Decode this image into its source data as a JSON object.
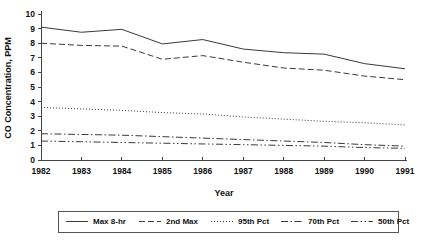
{
  "chart_data": {
    "type": "line",
    "title": "",
    "xlabel": "Year",
    "ylabel": "CO Concentration, PPM",
    "x": [
      1982,
      1983,
      1984,
      1985,
      1986,
      1987,
      1988,
      1989,
      1990,
      1991
    ],
    "categories": [
      "1982",
      "1983",
      "1984",
      "1985",
      "1986",
      "1987",
      "1988",
      "1989",
      "1990",
      "1991"
    ],
    "xlim": [
      1982,
      1991
    ],
    "ylim": [
      0,
      10
    ],
    "yticks": [
      "0",
      "1",
      "2",
      "3",
      "4",
      "5",
      "6",
      "7",
      "8",
      "9",
      "10"
    ],
    "grid": false,
    "legend_position": "bottom",
    "series": [
      {
        "name": "Max 8-hr",
        "style": "solid",
        "values": [
          9.1,
          8.75,
          8.95,
          7.95,
          8.25,
          7.6,
          7.35,
          7.25,
          6.6,
          6.25
        ]
      },
      {
        "name": "2nd Max",
        "style": "dashed",
        "values": [
          8.0,
          7.85,
          7.8,
          6.9,
          7.15,
          6.7,
          6.3,
          6.15,
          5.75,
          5.5
        ]
      },
      {
        "name": "95th Pct",
        "style": "dotted",
        "values": [
          3.6,
          3.5,
          3.4,
          3.25,
          3.15,
          2.95,
          2.8,
          2.65,
          2.55,
          2.4
        ]
      },
      {
        "name": "70th Pct",
        "style": "dash-dot",
        "values": [
          1.8,
          1.75,
          1.7,
          1.6,
          1.5,
          1.4,
          1.3,
          1.2,
          1.05,
          0.95
        ]
      },
      {
        "name": "50th Pct",
        "style": "dash-dot-dot",
        "values": [
          1.3,
          1.25,
          1.2,
          1.15,
          1.1,
          1.05,
          1.0,
          0.95,
          0.85,
          0.8
        ]
      }
    ]
  },
  "axes": {
    "y_title": "CO Concentration, PPM",
    "x_title": "Year"
  },
  "legend": {
    "items": [
      {
        "label": "Max 8-hr"
      },
      {
        "label": "2nd Max"
      },
      {
        "label": "95th Pct"
      },
      {
        "label": "70th Pct"
      },
      {
        "label": "50th Pct"
      }
    ]
  },
  "colors": {
    "line": "#3a3a3a",
    "axis": "#444444",
    "text": "#111111",
    "background": "#ffffff"
  }
}
